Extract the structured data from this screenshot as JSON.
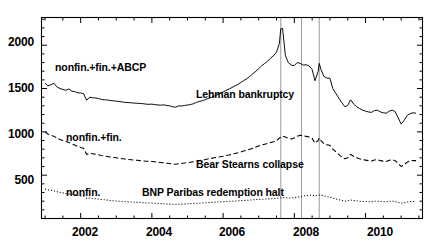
{
  "chart_data": {
    "type": "line",
    "title": "",
    "xlabel": "",
    "ylabel": "",
    "xlim": [
      2000.9,
      2011.6
    ],
    "ylim": [
      0,
      2320
    ],
    "grid": false,
    "legend_position": "inline-annotations",
    "y_ticks": [
      500,
      1000,
      1500,
      2000
    ],
    "x_ticks": [
      2002,
      2004,
      2006,
      2008,
      2010
    ],
    "y_minor_step": 100,
    "x_minor_step": 0.5,
    "units": "USD billions",
    "series": [
      {
        "name": "nonfin.+fin.+ABCP",
        "style": "solid",
        "color": "#000000",
        "label_x": 2002.2,
        "label_y": 1640,
        "x": [
          2001.0,
          2001.08,
          2001.17,
          2001.25,
          2001.33,
          2001.42,
          2001.5,
          2001.58,
          2001.67,
          2001.75,
          2001.83,
          2001.92,
          2002.0,
          2002.08,
          2002.17,
          2002.25,
          2002.33,
          2002.42,
          2002.5,
          2002.58,
          2002.67,
          2002.75,
          2002.83,
          2002.92,
          2003.0,
          2003.08,
          2003.17,
          2003.25,
          2003.33,
          2003.42,
          2003.5,
          2003.58,
          2003.67,
          2003.75,
          2003.83,
          2003.92,
          2004.0,
          2004.08,
          2004.17,
          2004.25,
          2004.33,
          2004.42,
          2004.5,
          2004.58,
          2004.67,
          2004.75,
          2004.83,
          2004.92,
          2005.0,
          2005.08,
          2005.17,
          2005.25,
          2005.33,
          2005.42,
          2005.5,
          2005.58,
          2005.67,
          2005.75,
          2005.83,
          2005.92,
          2006.0,
          2006.08,
          2006.17,
          2006.25,
          2006.33,
          2006.42,
          2006.5,
          2006.58,
          2006.67,
          2006.75,
          2006.83,
          2006.92,
          2007.0,
          2007.08,
          2007.17,
          2007.25,
          2007.33,
          2007.42,
          2007.5,
          2007.58,
          2007.62,
          2007.67,
          2007.75,
          2007.83,
          2007.92,
          2008.0,
          2008.08,
          2008.17,
          2008.25,
          2008.33,
          2008.42,
          2008.5,
          2008.58,
          2008.67,
          2008.7,
          2008.75,
          2008.83,
          2008.92,
          2009.0,
          2009.08,
          2009.17,
          2009.25,
          2009.33,
          2009.42,
          2009.5,
          2009.58,
          2009.67,
          2009.75,
          2009.83,
          2009.92,
          2010.0,
          2010.08,
          2010.17,
          2010.25,
          2010.33,
          2010.42,
          2010.5,
          2010.58,
          2010.67,
          2010.75,
          2010.83,
          2010.92,
          2011.0,
          2011.08,
          2011.17,
          2011.25,
          2011.33,
          2011.42
        ],
        "y": [
          1560,
          1530,
          1545,
          1560,
          1520,
          1500,
          1490,
          1480,
          1495,
          1470,
          1465,
          1450,
          1450,
          1440,
          1365,
          1400,
          1395,
          1390,
          1385,
          1375,
          1370,
          1368,
          1362,
          1358,
          1355,
          1350,
          1345,
          1340,
          1338,
          1336,
          1332,
          1330,
          1328,
          1325,
          1320,
          1318,
          1320,
          1315,
          1310,
          1308,
          1312,
          1305,
          1300,
          1290,
          1285,
          1300,
          1298,
          1305,
          1310,
          1315,
          1325,
          1340,
          1350,
          1360,
          1372,
          1385,
          1398,
          1412,
          1428,
          1445,
          1460,
          1478,
          1495,
          1512,
          1530,
          1548,
          1570,
          1592,
          1615,
          1640,
          1668,
          1700,
          1730,
          1762,
          1790,
          1815,
          1850,
          1880,
          1920,
          2020,
          2190,
          2195,
          1880,
          1800,
          1770,
          1765,
          1800,
          1790,
          1770,
          1775,
          1760,
          1720,
          1590,
          1700,
          1790,
          1720,
          1640,
          1620,
          1620,
          1500,
          1440,
          1390,
          1340,
          1290,
          1305,
          1370,
          1320,
          1290,
          1270,
          1250,
          1240,
          1230,
          1225,
          1245,
          1250,
          1230,
          1220,
          1215,
          1240,
          1250,
          1235,
          1160,
          1090,
          1130,
          1190,
          1210,
          1220,
          1215
        ]
      },
      {
        "name": "nonfin.+fin.",
        "style": "dashed",
        "color": "#000000",
        "label_x": 2002.2,
        "label_y": 890,
        "x": [
          2001.0,
          2001.08,
          2001.17,
          2001.25,
          2001.33,
          2001.42,
          2001.5,
          2001.58,
          2001.67,
          2001.75,
          2001.83,
          2001.92,
          2002.0,
          2002.08,
          2002.17,
          2002.25,
          2002.33,
          2002.42,
          2002.5,
          2002.58,
          2002.67,
          2002.75,
          2002.83,
          2002.92,
          2003.0,
          2003.08,
          2003.17,
          2003.25,
          2003.33,
          2003.42,
          2003.5,
          2003.58,
          2003.67,
          2003.75,
          2003.83,
          2003.92,
          2004.0,
          2004.08,
          2004.17,
          2004.25,
          2004.33,
          2004.42,
          2004.5,
          2004.58,
          2004.67,
          2004.75,
          2004.83,
          2004.92,
          2005.0,
          2005.08,
          2005.17,
          2005.25,
          2005.33,
          2005.42,
          2005.5,
          2005.58,
          2005.67,
          2005.75,
          2005.83,
          2005.92,
          2006.0,
          2006.08,
          2006.17,
          2006.25,
          2006.33,
          2006.42,
          2006.5,
          2006.58,
          2006.67,
          2006.75,
          2006.83,
          2006.92,
          2007.0,
          2007.08,
          2007.17,
          2007.25,
          2007.33,
          2007.42,
          2007.5,
          2007.58,
          2007.67,
          2007.75,
          2007.83,
          2007.92,
          2008.0,
          2008.08,
          2008.17,
          2008.25,
          2008.33,
          2008.42,
          2008.5,
          2008.58,
          2008.67,
          2008.7,
          2008.75,
          2008.83,
          2008.92,
          2009.0,
          2009.08,
          2009.17,
          2009.25,
          2009.33,
          2009.42,
          2009.5,
          2009.58,
          2009.67,
          2009.75,
          2009.83,
          2009.92,
          2010.0,
          2010.08,
          2010.17,
          2010.25,
          2010.33,
          2010.42,
          2010.5,
          2010.58,
          2010.67,
          2010.75,
          2010.83,
          2010.92,
          2011.0,
          2011.08,
          2011.17,
          2011.25,
          2011.33,
          2011.42
        ],
        "y": [
          1000,
          975,
          960,
          948,
          930,
          912,
          900,
          890,
          878,
          862,
          848,
          832,
          820,
          810,
          740,
          752,
          748,
          742,
          735,
          728,
          722,
          716,
          710,
          705,
          700,
          695,
          690,
          686,
          682,
          678,
          675,
          672,
          668,
          665,
          662,
          660,
          658,
          654,
          650,
          646,
          642,
          638,
          635,
          630,
          626,
          632,
          636,
          640,
          645,
          650,
          656,
          662,
          668,
          674,
          680,
          688,
          694,
          700,
          706,
          712,
          718,
          726,
          734,
          742,
          750,
          758,
          768,
          778,
          788,
          800,
          812,
          824,
          836,
          848,
          858,
          866,
          876,
          886,
          896,
          930,
          950,
          940,
          925,
          918,
          930,
          950,
          960,
          955,
          948,
          940,
          925,
          870,
          900,
          930,
          900,
          865,
          850,
          845,
          800,
          770,
          740,
          712,
          690,
          700,
          740,
          716,
          700,
          690,
          680,
          674,
          668,
          664,
          676,
          680,
          668,
          662,
          658,
          672,
          680,
          668,
          636,
          600,
          620,
          650,
          664,
          670,
          668
        ]
      },
      {
        "name": "nonfin.",
        "style": "dotted",
        "color": "#000000",
        "label_x": 2002.2,
        "label_y": 330,
        "x": [
          2001.0,
          2001.08,
          2001.17,
          2001.25,
          2001.33,
          2001.42,
          2001.5,
          2001.58,
          2001.67,
          2001.75,
          2001.83,
          2001.92,
          2002.0,
          2002.08,
          2002.17,
          2002.25,
          2002.33,
          2002.42,
          2002.5,
          2002.58,
          2002.67,
          2002.75,
          2002.83,
          2002.92,
          2003.0,
          2003.08,
          2003.17,
          2003.25,
          2003.33,
          2003.42,
          2003.5,
          2003.58,
          2003.67,
          2003.75,
          2003.83,
          2003.92,
          2004.0,
          2004.08,
          2004.17,
          2004.25,
          2004.33,
          2004.42,
          2004.5,
          2004.58,
          2004.67,
          2004.75,
          2004.83,
          2004.92,
          2005.0,
          2005.08,
          2005.17,
          2005.25,
          2005.33,
          2005.42,
          2005.5,
          2005.58,
          2005.67,
          2005.75,
          2005.83,
          2005.92,
          2006.0,
          2006.08,
          2006.17,
          2006.25,
          2006.33,
          2006.42,
          2006.5,
          2006.58,
          2006.67,
          2006.75,
          2006.83,
          2006.92,
          2007.0,
          2007.08,
          2007.17,
          2007.25,
          2007.33,
          2007.42,
          2007.5,
          2007.58,
          2007.67,
          2007.75,
          2007.83,
          2007.92,
          2008.0,
          2008.08,
          2008.17,
          2008.25,
          2008.33,
          2008.42,
          2008.5,
          2008.58,
          2008.67,
          2008.75,
          2008.83,
          2008.92,
          2009.0,
          2009.08,
          2009.17,
          2009.25,
          2009.33,
          2009.42,
          2009.5,
          2009.58,
          2009.67,
          2009.75,
          2009.83,
          2009.92,
          2010.0,
          2010.08,
          2010.17,
          2010.25,
          2010.33,
          2010.42,
          2010.5,
          2010.58,
          2010.67,
          2010.75,
          2010.83,
          2010.92,
          2011.0,
          2011.08,
          2011.17,
          2011.25,
          2011.33,
          2011.42
        ],
        "y": [
          340,
          332,
          326,
          318,
          310,
          302,
          296,
          290,
          284,
          278,
          272,
          266,
          260,
          256,
          232,
          236,
          232,
          228,
          224,
          220,
          216,
          212,
          208,
          205,
          202,
          199,
          196,
          194,
          192,
          190,
          188,
          186,
          184,
          182,
          180,
          179,
          178,
          176,
          174,
          172,
          170,
          168,
          166,
          164,
          162,
          164,
          166,
          168,
          170,
          172,
          174,
          176,
          178,
          180,
          182,
          184,
          186,
          188,
          190,
          192,
          194,
          196,
          198,
          200,
          202,
          204,
          206,
          208,
          210,
          212,
          215,
          218,
          220,
          222,
          224,
          226,
          228,
          230,
          232,
          238,
          242,
          240,
          238,
          236,
          240,
          246,
          252,
          258,
          264,
          268,
          272,
          262,
          268,
          272,
          262,
          252,
          248,
          236,
          226,
          216,
          208,
          200,
          204,
          214,
          208,
          204,
          200,
          198,
          196,
          194,
          193,
          198,
          200,
          196,
          194,
          192,
          198,
          200,
          196,
          186,
          176,
          182,
          190,
          194,
          196,
          195
        ]
      }
    ],
    "event_lines": [
      {
        "name": "bnp-paribas-line",
        "x": 2007.62
      },
      {
        "name": "bear-stearns-line",
        "x": 2008.2
      },
      {
        "name": "lehman-line",
        "x": 2008.7
      }
    ],
    "annotations": [
      {
        "name": "lehman-bankruptcy",
        "text": "Lehman bankruptcy",
        "x": 2006.25,
        "y": 1240
      },
      {
        "name": "bear-stearns-collapse",
        "text": "Bear Stearns collapse",
        "x": 2006.25,
        "y": 530
      },
      {
        "name": "bnp-paribas-redemption-halt",
        "text": "BNP Paribas redemption halt",
        "x": 2004.45,
        "y": 330
      }
    ]
  },
  "axis": {
    "y_tick_labels": [
      "2000",
      "1500",
      "1000",
      "500"
    ],
    "x_tick_labels": [
      "2002",
      "2004",
      "2006",
      "2008",
      "2010"
    ]
  },
  "series_labels": {
    "s0": "nonfin.+fin.+ABCP",
    "s1": "nonfin.+fin.",
    "s2": "nonfin."
  },
  "annotation_labels": {
    "lehman": "Lehman bankruptcy",
    "bear": "Bear Stearns collapse",
    "bnp": "BNP Paribas redemption halt"
  },
  "colors": {
    "line": "#000000",
    "axis": "#000000",
    "event_line": "#9a9a9a",
    "background": "#ffffff"
  }
}
